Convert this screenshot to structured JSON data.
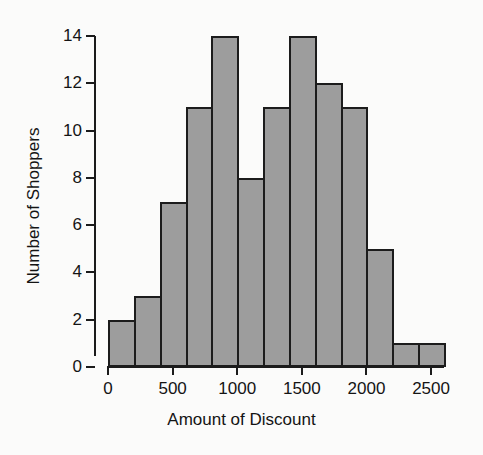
{
  "chart_data": {
    "type": "bar",
    "title": "",
    "subtitle": "",
    "xlabel": "Amount of Discount",
    "ylabel": "Number of Shoppers",
    "xlim": [
      -100,
      2700
    ],
    "ylim": [
      0,
      14
    ],
    "grid": false,
    "legend": "none",
    "bin_width": 200,
    "bin_edges": [
      0,
      200,
      400,
      600,
      800,
      1000,
      1200,
      1400,
      1600,
      1800,
      2000,
      2200,
      2400,
      2600
    ],
    "categories": [
      "0-200",
      "200-400",
      "400-600",
      "600-800",
      "800-1000",
      "1000-1200",
      "1200-1400",
      "1400-1600",
      "1600-1800",
      "1800-2000",
      "2000-2200",
      "2200-2400",
      "2400-2600"
    ],
    "values": [
      2,
      3,
      7,
      11,
      14,
      8,
      11,
      14,
      12,
      11,
      5,
      1,
      1
    ],
    "x_ticks": [
      0,
      500,
      1000,
      1500,
      2000,
      2500
    ],
    "x_tick_labels": [
      "0",
      "500",
      "1000",
      "1500",
      "2000",
      "2500"
    ],
    "y_ticks": [
      0,
      2,
      4,
      6,
      8,
      10,
      12,
      14
    ],
    "y_tick_labels": [
      "0",
      "2",
      "4",
      "6",
      "8",
      "10",
      "12",
      "14"
    ],
    "total_count": 100,
    "bar_fill_color": "#9d9d9d",
    "bar_edge_color": "#1c1c1c",
    "background_color": "#fbfbfa",
    "axis_color": "#1b1b1b",
    "text_color": "#141414"
  }
}
